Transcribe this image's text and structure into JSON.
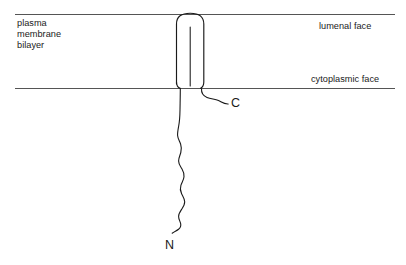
{
  "figure": {
    "background_color": "#ffffff",
    "stroke_color": "#1a1a1a",
    "membrane_line_color": "#555555",
    "width": 406,
    "height": 265
  },
  "labels": {
    "membrane": "plasma\nmembrane\nbilayer",
    "lumenal_face": "lumenal face",
    "cytoplasmic_face": "cytoplasmic face",
    "c_terminus": "C",
    "n_terminus": "N"
  },
  "geometry": {
    "membrane_top_y": 14,
    "membrane_bottom_y": 88,
    "membrane_line_x_start": 15,
    "membrane_line_x_end": 395,
    "helix_left_x": 176,
    "helix_right_x": 204,
    "helix_top_y": 13,
    "helix_bottom_y": 87,
    "helix_corner_radius": 11,
    "inner_line_x": 190,
    "inner_line_top_y": 27,
    "chain_start_x": 180,
    "chain_start_y": 88,
    "n_chain_end_x": 172,
    "n_chain_end_y": 233,
    "c_chain_end_x": 228,
    "c_chain_end_y": 104
  }
}
